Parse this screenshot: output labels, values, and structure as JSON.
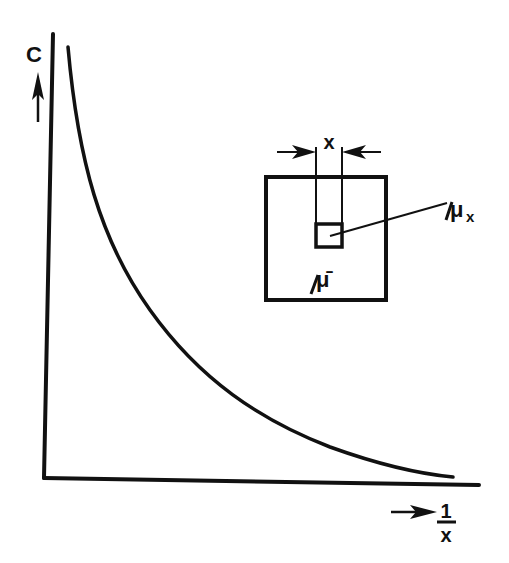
{
  "diagram": {
    "type": "concentration-vs-inverse-size plot with inset",
    "colors": {
      "ink": "#111111",
      "background": "#ffffff"
    },
    "y_axis": {
      "label": "C",
      "arrow": "up-arrow"
    },
    "x_axis": {
      "label_numerator": "1",
      "label_denominator": "x",
      "arrow": "right-arrow"
    },
    "curve": {
      "description": "hyperbolic decay, C proportional to 1/x"
    },
    "inset": {
      "dimension_label": "x",
      "sub_region_label": "μ",
      "sub_region_subscript": "x",
      "region_label": "μ̄"
    }
  }
}
